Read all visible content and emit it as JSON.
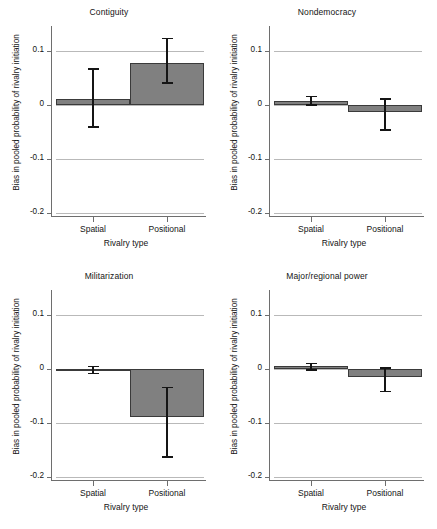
{
  "figure": {
    "axis_label_x": "Rivalry type",
    "axis_label_y": "Bias in pooled probability of rivalry initiation",
    "categories": [
      "Spatial",
      "Positional"
    ],
    "ytick_labels": [
      "0.1",
      "0",
      "-0.1",
      "-0.2"
    ],
    "colors": {
      "bar_fill": "#808080",
      "bar_stroke": "#3a3a3a",
      "error_bar": "#151515",
      "grid": "#b9b9b9",
      "axis": "#6e6e6e",
      "text": "#141414",
      "background": "#ffffff"
    }
  },
  "chart_data": [
    {
      "type": "bar",
      "title": "Contiguity",
      "xlabel": "Rivalry type",
      "ylabel": "Bias in pooled probability of rivalry initiation",
      "categories": [
        "Spatial",
        "Positional"
      ],
      "values": [
        0.011,
        0.078
      ],
      "error_low": [
        -0.039,
        0.042
      ],
      "error_high": [
        0.068,
        0.125
      ],
      "ylim": [
        -0.215,
        0.13
      ],
      "yticks": [
        0.1,
        0,
        -0.1,
        -0.2
      ],
      "grid": true,
      "legend": "none"
    },
    {
      "type": "bar",
      "title": "Nondemocracy",
      "xlabel": "Rivalry type",
      "ylabel": "Bias in pooled probability of rivalry initiation",
      "categories": [
        "Spatial",
        "Positional"
      ],
      "values": [
        0.008,
        -0.013
      ],
      "error_low": [
        0.002,
        -0.045
      ],
      "error_high": [
        0.017,
        0.013
      ],
      "ylim": [
        -0.215,
        0.13
      ],
      "yticks": [
        0.1,
        0,
        -0.1,
        -0.2
      ],
      "grid": true,
      "legend": "none"
    },
    {
      "type": "bar",
      "title": "Militarization",
      "xlabel": "Rivalry type",
      "ylabel": "Bias in pooled probability of rivalry initiation",
      "categories": [
        "Spatial",
        "Positional"
      ],
      "values": [
        -0.001,
        -0.088
      ],
      "error_low": [
        -0.007,
        -0.161
      ],
      "error_high": [
        0.006,
        -0.033
      ],
      "ylim": [
        -0.215,
        0.13
      ],
      "yticks": [
        0.1,
        0,
        -0.1,
        -0.2
      ],
      "grid": true,
      "legend": "none"
    },
    {
      "type": "bar",
      "title": "Major/regional power",
      "xlabel": "Rivalry type",
      "ylabel": "Bias in pooled probability of rivalry initiation",
      "categories": [
        "Spatial",
        "Positional"
      ],
      "values": [
        0.005,
        -0.014
      ],
      "error_low": [
        0.0,
        -0.04
      ],
      "error_high": [
        0.012,
        0.003
      ],
      "ylim": [
        -0.215,
        0.13
      ],
      "yticks": [
        0.1,
        0,
        -0.1,
        -0.2
      ],
      "grid": true,
      "legend": "none"
    }
  ]
}
